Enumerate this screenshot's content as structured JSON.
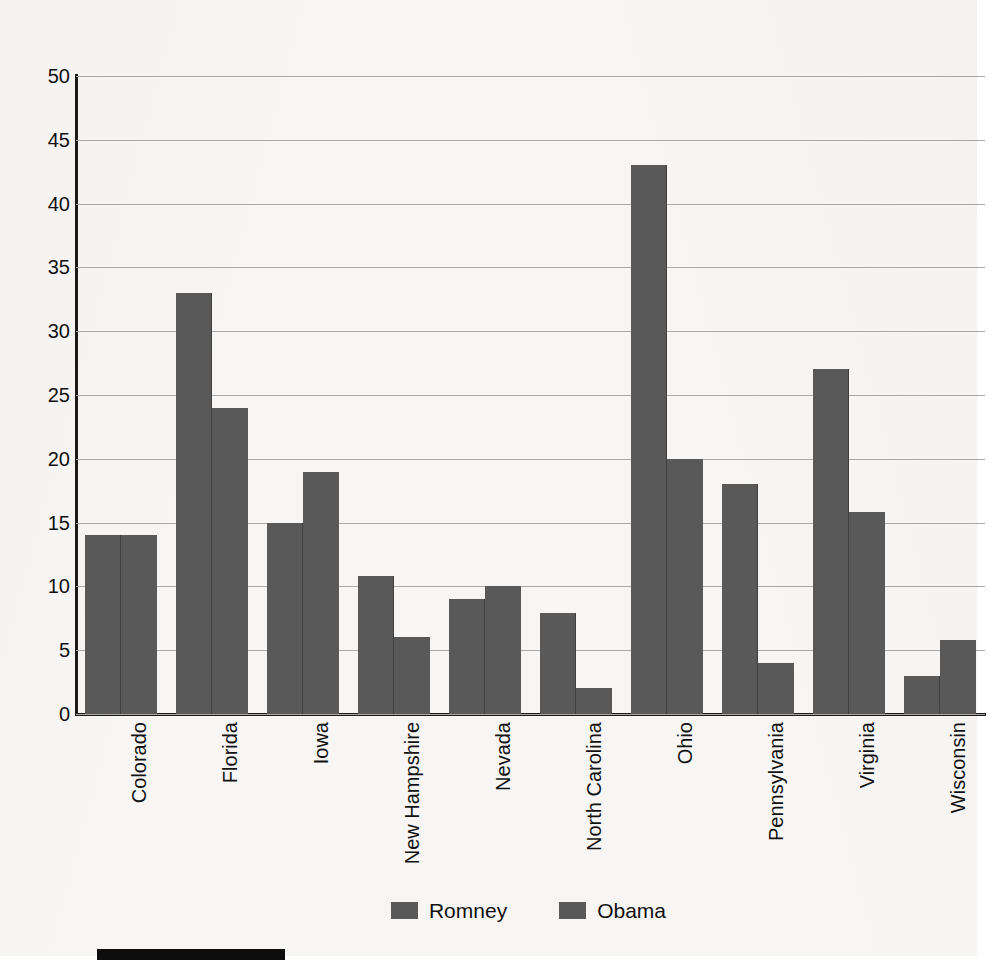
{
  "chart_data": {
    "type": "bar",
    "title": "",
    "subtitle": "",
    "xlabel": "",
    "ylabel": "",
    "ylim": [
      0,
      50
    ],
    "y_ticks": [
      0,
      5,
      10,
      15,
      20,
      25,
      30,
      35,
      40,
      45,
      50
    ],
    "y_tick_labels": [
      "0",
      "5",
      "10",
      "15",
      "20",
      "25",
      "30",
      "35",
      "40",
      "45",
      "50"
    ],
    "grid": true,
    "grid_axis": "y",
    "legend_position": "bottom-center",
    "categories": [
      "Colorado",
      "Florida",
      "Iowa",
      "New Hampshire",
      "Nevada",
      "North Carolina",
      "Ohio",
      "Pennsylvania",
      "Virginia",
      "Wisconsin"
    ],
    "series": [
      {
        "name": "Romney",
        "color": "#595959",
        "values": [
          14,
          33,
          15,
          10.8,
          9,
          7.9,
          43,
          18,
          27,
          3
        ]
      },
      {
        "name": "Obama",
        "color": "#595959",
        "values": [
          14,
          24,
          19,
          6,
          10,
          2,
          20,
          4,
          15.8,
          5.8
        ]
      }
    ],
    "annotations": []
  },
  "legend": {
    "entries": [
      {
        "label": "Romney",
        "swatch_name": "legend-swatch-romney"
      },
      {
        "label": "Obama",
        "swatch_name": "legend-swatch-obama"
      }
    ]
  },
  "colors": {
    "bar_fill": "#595959",
    "bar_divider": "#3f3f3f",
    "gridline": "#a9a9a9",
    "axis": "#1a1a1a",
    "text": "#111111",
    "page_background": "#f7f6f4",
    "bottom_rule": "#0d0d0d"
  },
  "footer": {
    "rule_present": true
  }
}
